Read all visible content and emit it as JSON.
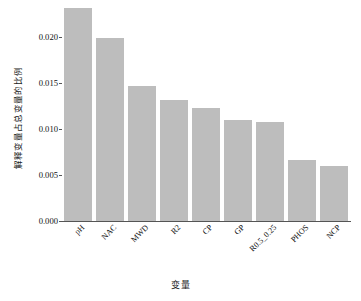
{
  "chart_data": {
    "type": "bar",
    "title": "",
    "subtitle": "",
    "xlabel": "变量",
    "ylabel": "解释变量占总变量的比例",
    "categories": [
      "pH",
      "NAC",
      "MWD",
      "R2",
      "CP",
      "GP",
      "R0.5_0.25",
      "PHOS",
      "NCP"
    ],
    "values": [
      0.0231,
      0.0199,
      0.0147,
      0.0131,
      0.0123,
      0.011,
      0.0108,
      0.0066,
      0.006
    ],
    "series": [
      {
        "name": "解释变量占总变量的比例",
        "values": [
          0.0231,
          0.0199,
          0.0147,
          0.0131,
          0.0123,
          0.011,
          0.0108,
          0.0066,
          0.006
        ]
      }
    ],
    "ylim": [
      0.0,
      0.02315
    ],
    "yticks": [
      0.0,
      0.005,
      0.01,
      0.015,
      0.02
    ],
    "ytick_labels": [
      "0.000",
      "0.005",
      "0.010",
      "0.015",
      "0.020"
    ],
    "grid": false,
    "legend": false,
    "legend_position": "none",
    "bar_color": "#bdbdbd",
    "axis_color": "#555555",
    "background_color": "#ffffff",
    "xtick_rotation": 45
  }
}
